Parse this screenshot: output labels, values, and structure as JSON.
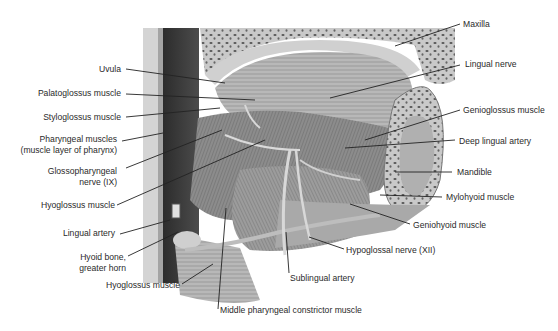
{
  "diagram": {
    "labels_left": [
      {
        "id": "uvula",
        "text": "Uvula"
      },
      {
        "id": "palatoglossus",
        "text": "Palatoglossus muscle"
      },
      {
        "id": "styloglossus",
        "text": "Styloglossus muscle"
      },
      {
        "id": "pharyngeal-1",
        "text": "Pharyngeal muscles"
      },
      {
        "id": "pharyngeal-2",
        "text": "(muscle layer of pharynx)"
      },
      {
        "id": "glosso-1",
        "text": "Glossopharyngeal"
      },
      {
        "id": "glosso-2",
        "text": "nerve (IX)"
      },
      {
        "id": "hyoglossus-upper",
        "text": "Hyoglossus muscle"
      },
      {
        "id": "lingual-artery",
        "text": "Lingual artery"
      },
      {
        "id": "hyoid-1",
        "text": "Hyoid bone,"
      },
      {
        "id": "hyoid-2",
        "text": "greater horn"
      },
      {
        "id": "hyoglossus-lower",
        "text": "Hyoglossus muscle"
      }
    ],
    "labels_right": [
      {
        "id": "maxilla",
        "text": "Maxilla"
      },
      {
        "id": "lingual-nerve",
        "text": "Lingual nerve"
      },
      {
        "id": "genioglossus",
        "text": "Genioglossus muscle"
      },
      {
        "id": "deep-lingual-artery",
        "text": "Deep lingual artery"
      },
      {
        "id": "mandible",
        "text": "Mandible"
      },
      {
        "id": "mylohyoid",
        "text": "Mylohyoid muscle"
      },
      {
        "id": "geniohyoid",
        "text": "Geniohyoid muscle"
      },
      {
        "id": "hypoglossal",
        "text": "Hypoglossal nerve (XII)"
      }
    ],
    "labels_bottom": [
      {
        "id": "sublingual-artery",
        "text": "Sublingual artery"
      },
      {
        "id": "middle-constrictor",
        "text": "Middle pharyngeal constrictor muscle"
      }
    ]
  }
}
